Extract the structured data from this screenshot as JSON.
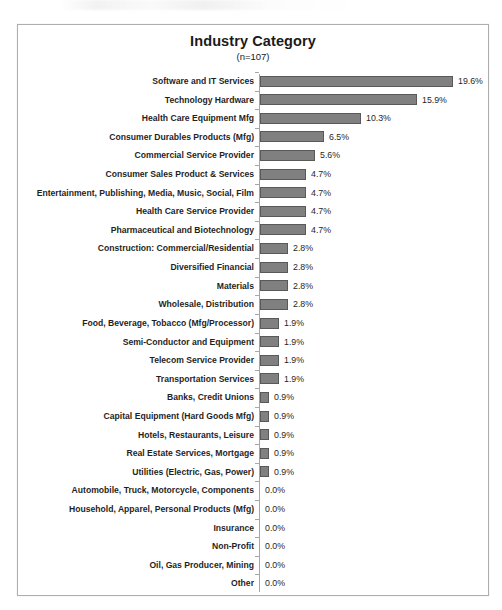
{
  "chart_data": {
    "type": "bar",
    "orientation": "horizontal",
    "title": "Industry Category",
    "subtitle": "(n=107)",
    "xlabel": "",
    "ylabel": "",
    "grid": false,
    "legend": false,
    "value_suffix": "%",
    "xlim": [
      0,
      19.6
    ],
    "categories": [
      "Software and IT Services",
      "Technology Hardware",
      "Health Care Equipment Mfg",
      "Consumer Durables Products (Mfg)",
      "Commercial Service Provider",
      "Consumer Sales Product & Services",
      "Entertainment, Publishing, Media, Music, Social, Film",
      "Health Care Service Provider",
      "Pharmaceutical and Biotechnology",
      "Construction: Commercial/Residential",
      "Diversified Financial",
      "Materials",
      "Wholesale, Distribution",
      "Food, Beverage, Tobacco (Mfg/Processor)",
      "Semi-Conductor and Equipment",
      "Telecom Service Provider",
      "Transportation Services",
      "Banks, Credit Unions",
      "Capital Equipment (Hard Goods Mfg)",
      "Hotels, Restaurants, Leisure",
      "Real Estate Services, Mortgage",
      "Utilities (Electric, Gas, Power)",
      "Automobile, Truck, Motorcycle, Components",
      "Household, Apparel, Personal Products (Mfg)",
      "Insurance",
      "Non-Profit",
      "Oil, Gas Producer, Mining",
      "Other"
    ],
    "values": [
      19.6,
      15.9,
      10.3,
      6.5,
      5.6,
      4.7,
      4.7,
      4.7,
      4.7,
      2.8,
      2.8,
      2.8,
      2.8,
      1.9,
      1.9,
      1.9,
      1.9,
      0.9,
      0.9,
      0.9,
      0.9,
      0.9,
      0.0,
      0.0,
      0.0,
      0.0,
      0.0,
      0.0
    ],
    "value_labels": [
      "19.6%",
      "15.9%",
      "10.3%",
      "6.5%",
      "5.6%",
      "4.7%",
      "4.7%",
      "4.7%",
      "4.7%",
      "2.8%",
      "2.8%",
      "2.8%",
      "2.8%",
      "1.9%",
      "1.9%",
      "1.9%",
      "1.9%",
      "0.9%",
      "0.9%",
      "0.9%",
      "0.9%",
      "0.9%",
      "0.0%",
      "0.0%",
      "0.0%",
      "0.0%",
      "0.0%",
      "0.0%"
    ],
    "colors": {
      "bar_fill": "#808080",
      "bar_border": "#595959",
      "axis": "#a6a6a6",
      "frame_border": "#aeaeae",
      "text": "#1f1f1f",
      "background": "#ffffff"
    }
  }
}
